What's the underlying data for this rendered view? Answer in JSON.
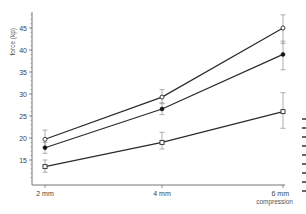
{
  "chart_data": {
    "type": "line",
    "title": "",
    "xlabel": "compression",
    "ylabel": "force (kp)",
    "categories": [
      "2 mm",
      "4 mm",
      "6 mm"
    ],
    "ylim": [
      11,
      49
    ],
    "yticks": [
      15,
      20,
      25,
      30,
      35,
      40,
      45
    ],
    "grid": false,
    "legend": null,
    "series": [
      {
        "name": "open circle",
        "marker": "circle-open",
        "values": [
          19.7,
          29.3,
          45.0
        ],
        "error_low": [
          18.0,
          27.8,
          41.5
        ],
        "error_high": [
          21.8,
          31.0,
          48.0
        ]
      },
      {
        "name": "filled circle",
        "marker": "circle-filled",
        "values": [
          17.8,
          26.6,
          39.0
        ],
        "error_low": [
          16.5,
          25.3,
          35.5
        ],
        "error_high": [
          19.0,
          28.0,
          42.0
        ]
      },
      {
        "name": "open square",
        "marker": "square-open",
        "values": [
          13.5,
          19.0,
          26.0
        ],
        "error_low": [
          12.2,
          17.5,
          22.2
        ],
        "error_high": [
          15.0,
          21.3,
          30.3
        ]
      }
    ]
  },
  "colors": {
    "line": "#2a2a2a",
    "errorbar": "#9a9a9a",
    "axis": "#777777"
  }
}
